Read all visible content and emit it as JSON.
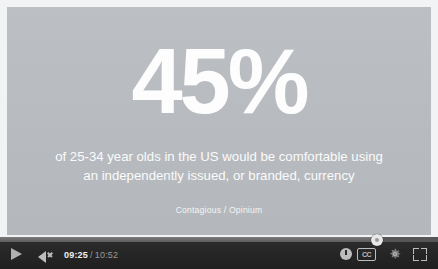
{
  "slide": {
    "headline": "45%",
    "statement_line_1": "of 25-34 year olds in the US would be comfortable using",
    "statement_line_2": "an independently issued, or branded, currency",
    "attribution": "Contagious / Opinium",
    "background_color": "#b9bdc1",
    "text_color": "#fdfdfd"
  },
  "player": {
    "controls": {
      "play_label": "Play",
      "volume_label": "Mute",
      "time_current": "09:25",
      "time_separator": "/",
      "time_total": "10:52",
      "annotations_label": "Annotations",
      "captions_label": "CC",
      "settings_label": "Settings",
      "fullscreen_label": "Fullscreen"
    },
    "progress": {
      "played_percent": 86,
      "bar_color": "#6f6f6f",
      "track_color": "#4a4a4a"
    },
    "chrome_color": "#262626"
  }
}
